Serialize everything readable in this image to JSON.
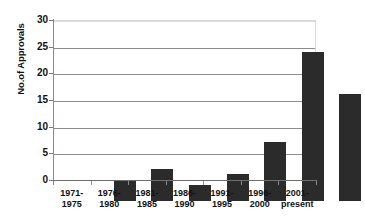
{
  "chart_data": {
    "type": "bar",
    "title": "",
    "xlabel": "",
    "ylabel": "No.of Approvals",
    "categories": [
      "1971-\n1975",
      "1976-\n1980",
      "1981-\n1985",
      "1986-\n1990",
      "1991-\n1995",
      "1996-\n2000",
      "2001-\npresent"
    ],
    "category_lines": [
      [
        "1971-",
        "1975"
      ],
      [
        "1976-",
        "1980"
      ],
      [
        "1981-",
        "1985"
      ],
      [
        "1986-",
        "1990"
      ],
      [
        "1991-",
        "1995"
      ],
      [
        "1996-",
        "2000"
      ],
      [
        "2001-",
        "present"
      ]
    ],
    "values": [
      4,
      6,
      3,
      5,
      11,
      28,
      20
    ],
    "ylim": [
      0,
      30
    ],
    "ytick_labels": [
      "30",
      "25",
      "20",
      "15",
      "10",
      "5",
      "0"
    ],
    "ytick_values": [
      30,
      25,
      20,
      15,
      10,
      5,
      0
    ],
    "grid": "horizontal",
    "legend": "none",
    "bar_color": "#2b2b2b",
    "gridline_color": "#8c8c8c",
    "axis_color": "#7a7a7a",
    "background_color": "#ffffff"
  }
}
